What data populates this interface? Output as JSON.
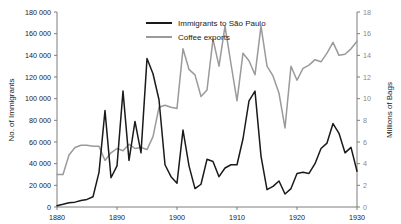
{
  "chart_data": {
    "type": "line",
    "title": "",
    "subtitle": "",
    "xlabel": "",
    "ylabel": "No. of Immigrants",
    "y2label": "Millions of Bags",
    "grid": false,
    "legend_position": "top-center-inside",
    "xlim": [
      1880,
      1930
    ],
    "ylim": [
      0,
      180000
    ],
    "y2lim": [
      0,
      18
    ],
    "xticks": [
      1880,
      1890,
      1900,
      1910,
      1920,
      1930
    ],
    "xticklabels": [
      "1880",
      "1890",
      "1900",
      "1910",
      "1920",
      "1930"
    ],
    "yticks": [
      0,
      20000,
      40000,
      60000,
      80000,
      100000,
      120000,
      140000,
      160000,
      180000
    ],
    "yticklabels": [
      "0",
      "20 000",
      "40 000",
      "60 000",
      "80 000",
      "100 000",
      "120 000",
      "140 000",
      "160 000",
      "180 000"
    ],
    "y2ticks": [
      0,
      2,
      4,
      6,
      8,
      10,
      12,
      14,
      16,
      18
    ],
    "y2ticklabels": [
      "0",
      "2",
      "4",
      "6",
      "8",
      "10",
      "12",
      "14",
      "16",
      "18"
    ],
    "x": [
      1880,
      1881,
      1882,
      1883,
      1884,
      1885,
      1886,
      1887,
      1888,
      1889,
      1890,
      1891,
      1892,
      1893,
      1894,
      1895,
      1896,
      1897,
      1898,
      1899,
      1900,
      1901,
      1902,
      1903,
      1904,
      1905,
      1906,
      1907,
      1908,
      1909,
      1910,
      1911,
      1912,
      1913,
      1914,
      1915,
      1916,
      1917,
      1918,
      1919,
      1920,
      1921,
      1922,
      1923,
      1924,
      1925,
      1926,
      1927,
      1928,
      1929,
      1930
    ],
    "series": [
      {
        "name": "Immigrants to São Paulo",
        "axis": "left",
        "color": "#1a1a1a",
        "units": "persons",
        "values": [
          1200,
          2500,
          4000,
          4500,
          6000,
          7000,
          9500,
          32000,
          89000,
          27000,
          38000,
          107000,
          43000,
          79000,
          50000,
          137000,
          123000,
          99000,
          39000,
          28000,
          22000,
          71000,
          38000,
          17000,
          21000,
          44000,
          42000,
          28000,
          36000,
          39000,
          39000,
          63000,
          98000,
          107000,
          47000,
          16000,
          19000,
          24000,
          12000,
          17000,
          31000,
          32000,
          31000,
          40000,
          54000,
          59000,
          77000,
          68000,
          50000,
          55000,
          33000
        ]
      },
      {
        "name": "Coffee exports",
        "axis": "right",
        "color": "#9a9a9a",
        "units": "millions of bags",
        "values": [
          3.0,
          3.0,
          4.8,
          5.5,
          5.7,
          5.7,
          5.6,
          5.6,
          4.3,
          5.0,
          5.4,
          5.2,
          5.8,
          5.4,
          5.5,
          5.3,
          6.5,
          9.2,
          9.4,
          9.2,
          9.1,
          14.6,
          12.7,
          12.2,
          10.2,
          10.8,
          15.5,
          13.0,
          16.7,
          13.2,
          9.8,
          14.2,
          13.5,
          12.2,
          16.7,
          13.0,
          12.1,
          10.5,
          7.3,
          13.0,
          11.7,
          12.8,
          13.1,
          13.6,
          13.4,
          14.2,
          15.2,
          14.0,
          14.1,
          14.6,
          15.3
        ]
      }
    ],
    "annotations": []
  },
  "legend": {
    "items": [
      {
        "label": "Immigrants to São Paulo",
        "swatch": "line-dark"
      },
      {
        "label": "Coffee exports",
        "swatch": "line-gray"
      }
    ]
  },
  "colors": {
    "immigrants": "#1a1a1a",
    "coffee": "#9a9a9a",
    "axis": "#7d7d7d",
    "text": "#1a1a1a",
    "right_tick_text": "#8a8a8a",
    "background": "#ffffff"
  }
}
